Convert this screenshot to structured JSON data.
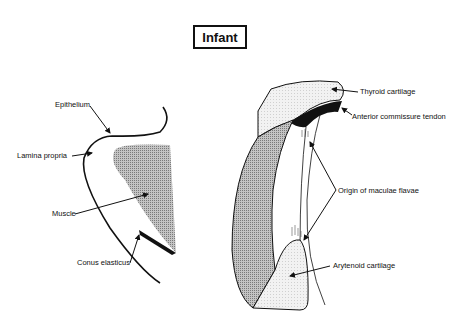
{
  "title": "Infant",
  "left_panel": {
    "labels": {
      "epithelium": "Epithelium",
      "lamina_propria": "Lamina propria",
      "muscle": "Muscle",
      "conus_elasticus": "Conus elasticus"
    }
  },
  "right_panel": {
    "labels": {
      "thyroid_cartilage": "Thyroid cartilage",
      "anterior_commissure_tendon": "Anterior commissure tendon",
      "origin_of_maculae_flavae": "Origin of maculae flavae",
      "arytenoid_cartilage": "Arytenoid cartilage"
    }
  },
  "colors": {
    "ink": "#111111",
    "muscle_fill": "#a8a8a8",
    "cartilage_fill": "#ededed",
    "tendon_fill": "#111111"
  }
}
